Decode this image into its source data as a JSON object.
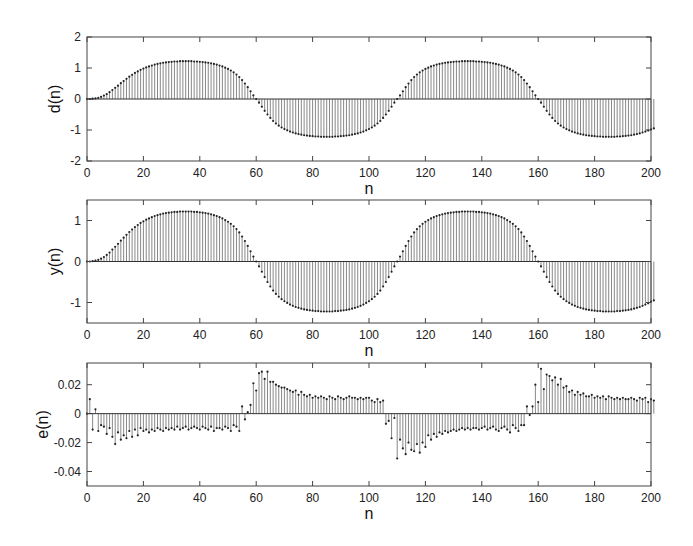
{
  "figure": {
    "width": 693,
    "height": 546,
    "stem_color": "#555555",
    "marker_color": "#222222",
    "axes_color": "#444444"
  },
  "chart_data": [
    {
      "type": "stem",
      "title": "",
      "xlabel": "n",
      "ylabel": "d(n)",
      "xlim": [
        0,
        200
      ],
      "ylim": [
        -2,
        2
      ],
      "xticks": [
        0,
        20,
        40,
        60,
        80,
        100,
        120,
        140,
        160,
        180,
        200
      ],
      "yticks": [
        -2,
        -1,
        0,
        1,
        2
      ],
      "yticklabels": [
        "-2",
        "-1",
        "0",
        "1",
        "2"
      ],
      "box": {
        "left": 87,
        "top": 37,
        "right": 651,
        "bottom": 161
      },
      "x_range": [
        0,
        200
      ],
      "y_values": [
        0.0,
        0.0,
        0.01,
        0.02,
        0.04,
        0.07,
        0.11,
        0.16,
        0.22,
        0.29,
        0.36,
        0.43,
        0.51,
        0.58,
        0.65,
        0.72,
        0.78,
        0.84,
        0.89,
        0.94,
        0.98,
        1.02,
        1.05,
        1.08,
        1.11,
        1.13,
        1.15,
        1.17,
        1.18,
        1.19,
        1.2,
        1.21,
        1.21,
        1.22,
        1.22,
        1.22,
        1.22,
        1.22,
        1.21,
        1.21,
        1.2,
        1.19,
        1.18,
        1.17,
        1.15,
        1.13,
        1.11,
        1.08,
        1.05,
        1.01,
        0.97,
        0.92,
        0.86,
        0.79,
        0.71,
        0.61,
        0.5,
        0.38,
        0.25,
        0.12,
        0.0,
        -0.12,
        -0.25,
        -0.38,
        -0.5,
        -0.61,
        -0.71,
        -0.79,
        -0.86,
        -0.92,
        -0.97,
        -1.01,
        -1.05,
        -1.08,
        -1.11,
        -1.13,
        -1.15,
        -1.17,
        -1.18,
        -1.19,
        -1.2,
        -1.21,
        -1.21,
        -1.22,
        -1.22,
        -1.22,
        -1.22,
        -1.22,
        -1.21,
        -1.21,
        -1.2,
        -1.19,
        -1.18,
        -1.17,
        -1.15,
        -1.13,
        -1.11,
        -1.08,
        -1.05,
        -1.01,
        -0.97,
        -0.92,
        -0.86,
        -0.79,
        -0.71,
        -0.61,
        -0.5,
        -0.38,
        -0.25,
        -0.12,
        0.0,
        0.12,
        0.25,
        0.38,
        0.5,
        0.61,
        0.71,
        0.79,
        0.86,
        0.92,
        0.97,
        1.01,
        1.05,
        1.08,
        1.11,
        1.13,
        1.15,
        1.17,
        1.18,
        1.19,
        1.2,
        1.21,
        1.21,
        1.22,
        1.22,
        1.22,
        1.22,
        1.22,
        1.21,
        1.21,
        1.2,
        1.19,
        1.18,
        1.17,
        1.15,
        1.13,
        1.11,
        1.08,
        1.05,
        1.01,
        0.97,
        0.92,
        0.86,
        0.79,
        0.71,
        0.61,
        0.5,
        0.38,
        0.25,
        0.12,
        0.0,
        -0.12,
        -0.25,
        -0.38,
        -0.5,
        -0.61,
        -0.71,
        -0.79,
        -0.86,
        -0.92,
        -0.97,
        -1.01,
        -1.05,
        -1.08,
        -1.11,
        -1.13,
        -1.15,
        -1.17,
        -1.18,
        -1.19,
        -1.2,
        -1.21,
        -1.21,
        -1.22,
        -1.22,
        -1.22,
        -1.22,
        -1.22,
        -1.21,
        -1.21,
        -1.2,
        -1.19,
        -1.18,
        -1.17,
        -1.15,
        -1.13,
        -1.11,
        -1.08,
        -1.05,
        -1.02,
        -0.98,
        -0.95
      ]
    },
    {
      "type": "stem",
      "title": "",
      "xlabel": "n",
      "ylabel": "y(n)",
      "xlim": [
        0,
        200
      ],
      "ylim": [
        -1.5,
        1.5
      ],
      "xticks": [
        0,
        20,
        40,
        60,
        80,
        100,
        120,
        140,
        160,
        180,
        200
      ],
      "yticks": [
        -1,
        0,
        1
      ],
      "yticklabels": [
        "-1",
        "0",
        "1"
      ],
      "box": {
        "left": 87,
        "top": 200,
        "right": 651,
        "bottom": 323
      },
      "x_range": [
        0,
        200
      ],
      "y_values": [
        0.0,
        0.0,
        0.01,
        0.02,
        0.04,
        0.07,
        0.11,
        0.16,
        0.22,
        0.29,
        0.36,
        0.43,
        0.51,
        0.58,
        0.65,
        0.72,
        0.78,
        0.84,
        0.89,
        0.94,
        0.98,
        1.02,
        1.05,
        1.08,
        1.11,
        1.13,
        1.15,
        1.17,
        1.18,
        1.19,
        1.2,
        1.21,
        1.21,
        1.22,
        1.22,
        1.22,
        1.22,
        1.22,
        1.21,
        1.21,
        1.2,
        1.19,
        1.18,
        1.17,
        1.15,
        1.13,
        1.11,
        1.08,
        1.05,
        1.01,
        0.97,
        0.92,
        0.86,
        0.79,
        0.71,
        0.61,
        0.5,
        0.38,
        0.25,
        0.12,
        0.0,
        -0.12,
        -0.25,
        -0.38,
        -0.5,
        -0.61,
        -0.71,
        -0.79,
        -0.86,
        -0.92,
        -0.97,
        -1.01,
        -1.05,
        -1.08,
        -1.11,
        -1.13,
        -1.15,
        -1.17,
        -1.18,
        -1.19,
        -1.2,
        -1.21,
        -1.21,
        -1.22,
        -1.22,
        -1.22,
        -1.22,
        -1.22,
        -1.21,
        -1.21,
        -1.2,
        -1.19,
        -1.18,
        -1.17,
        -1.15,
        -1.13,
        -1.11,
        -1.08,
        -1.05,
        -1.01,
        -0.97,
        -0.92,
        -0.86,
        -0.79,
        -0.71,
        -0.61,
        -0.5,
        -0.38,
        -0.25,
        -0.12,
        0.0,
        0.12,
        0.25,
        0.38,
        0.5,
        0.61,
        0.71,
        0.79,
        0.86,
        0.92,
        0.97,
        1.01,
        1.05,
        1.08,
        1.11,
        1.13,
        1.15,
        1.17,
        1.18,
        1.19,
        1.2,
        1.21,
        1.21,
        1.22,
        1.22,
        1.22,
        1.22,
        1.22,
        1.21,
        1.21,
        1.2,
        1.19,
        1.18,
        1.17,
        1.15,
        1.13,
        1.11,
        1.08,
        1.05,
        1.01,
        0.97,
        0.92,
        0.86,
        0.79,
        0.71,
        0.61,
        0.5,
        0.38,
        0.25,
        0.12,
        0.0,
        -0.12,
        -0.25,
        -0.38,
        -0.5,
        -0.61,
        -0.71,
        -0.79,
        -0.86,
        -0.92,
        -0.97,
        -1.01,
        -1.05,
        -1.08,
        -1.11,
        -1.13,
        -1.15,
        -1.17,
        -1.18,
        -1.19,
        -1.2,
        -1.21,
        -1.21,
        -1.22,
        -1.22,
        -1.22,
        -1.22,
        -1.22,
        -1.21,
        -1.21,
        -1.2,
        -1.19,
        -1.18,
        -1.17,
        -1.15,
        -1.13,
        -1.11,
        -1.08,
        -1.05,
        -1.02,
        -0.98,
        -0.95
      ]
    },
    {
      "type": "stem",
      "title": "",
      "xlabel": "n",
      "ylabel": "e(n)",
      "xlim": [
        0,
        200
      ],
      "ylim": [
        -0.05,
        0.035
      ],
      "xticks": [
        0,
        20,
        40,
        60,
        80,
        100,
        120,
        140,
        160,
        180,
        200
      ],
      "yticks": [
        -0.04,
        -0.02,
        0,
        0.02
      ],
      "yticklabels": [
        "-0.04",
        "-0.02",
        "0",
        "0.02"
      ],
      "box": {
        "left": 87,
        "top": 363,
        "right": 651,
        "bottom": 486
      },
      "x_range": [
        0,
        200
      ],
      "y_values": [
        0.0,
        0.01,
        -0.011,
        0.003,
        -0.012,
        -0.008,
        -0.009,
        -0.014,
        -0.01,
        -0.016,
        -0.021,
        -0.013,
        -0.018,
        -0.015,
        -0.017,
        -0.012,
        -0.016,
        -0.011,
        -0.015,
        -0.01,
        -0.012,
        -0.011,
        -0.013,
        -0.011,
        -0.012,
        -0.01,
        -0.011,
        -0.012,
        -0.01,
        -0.011,
        -0.01,
        -0.011,
        -0.009,
        -0.011,
        -0.01,
        -0.009,
        -0.011,
        -0.01,
        -0.009,
        -0.01,
        -0.011,
        -0.009,
        -0.01,
        -0.011,
        -0.009,
        -0.012,
        -0.01,
        -0.01,
        -0.011,
        -0.009,
        -0.01,
        -0.012,
        -0.008,
        -0.009,
        -0.012,
        0.005,
        -0.004,
        0.001,
        0.006,
        0.021,
        0.016,
        0.028,
        0.029,
        0.024,
        0.029,
        0.022,
        0.022,
        0.02,
        0.019,
        0.018,
        0.018,
        0.017,
        0.016,
        0.015,
        0.016,
        0.013,
        0.015,
        0.013,
        0.012,
        0.013,
        0.011,
        0.012,
        0.011,
        0.012,
        0.011,
        0.01,
        0.012,
        0.011,
        0.01,
        0.012,
        0.011,
        0.01,
        0.011,
        0.012,
        0.011,
        0.011,
        0.01,
        0.011,
        0.01,
        0.011,
        0.011,
        0.009,
        0.008,
        0.01,
        0.008,
        0.009,
        -0.007,
        -0.005,
        -0.017,
        -0.003,
        -0.031,
        -0.018,
        -0.024,
        -0.028,
        -0.02,
        -0.025,
        -0.026,
        -0.021,
        -0.027,
        -0.02,
        -0.023,
        -0.015,
        -0.018,
        -0.014,
        -0.016,
        -0.013,
        -0.014,
        -0.012,
        -0.013,
        -0.012,
        -0.011,
        -0.012,
        -0.011,
        -0.01,
        -0.011,
        -0.01,
        -0.011,
        -0.01,
        -0.01,
        -0.011,
        -0.01,
        -0.009,
        -0.011,
        -0.01,
        -0.009,
        -0.011,
        -0.012,
        -0.01,
        -0.009,
        -0.011,
        -0.013,
        -0.008,
        -0.01,
        -0.012,
        -0.008,
        -0.008,
        0.005,
        -0.001,
        0.005,
        0.02,
        0.008,
        0.031,
        0.017,
        0.027,
        0.026,
        0.023,
        0.025,
        0.02,
        0.024,
        0.018,
        0.019,
        0.015,
        0.016,
        0.013,
        0.015,
        0.013,
        0.014,
        0.012,
        0.012,
        0.013,
        0.011,
        0.012,
        0.011,
        0.012,
        0.01,
        0.012,
        0.011,
        0.01,
        0.011,
        0.01,
        0.011,
        0.01,
        0.01,
        0.011,
        0.01,
        0.009,
        0.011,
        0.01,
        0.011,
        0.008,
        0.01,
        0.009
      ]
    }
  ]
}
